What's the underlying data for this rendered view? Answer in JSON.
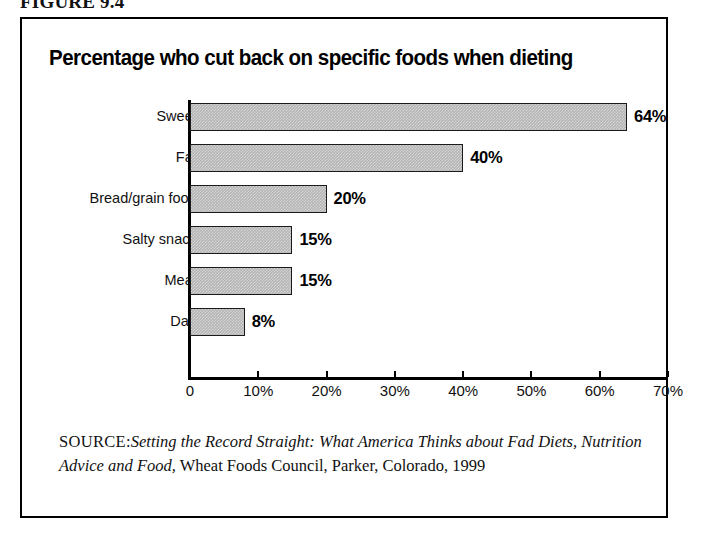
{
  "figure": {
    "number_label": "FIGURE 9.4"
  },
  "chart_data": {
    "type": "bar",
    "orientation": "horizontal",
    "title": "Percentage who cut back on specific foods when dieting",
    "categories": [
      "Sweets",
      "Fats",
      "Bread/grain foods",
      "Salty snacks",
      "Meats",
      "Dairy"
    ],
    "values": [
      64,
      40,
      20,
      15,
      15,
      8
    ],
    "value_labels": [
      "64%",
      "40%",
      "20%",
      "15%",
      "15%",
      "8%"
    ],
    "xlabel": "",
    "ylabel": "",
    "xlim": [
      0,
      70
    ],
    "xticks": [
      0,
      10,
      20,
      30,
      40,
      50,
      60,
      70
    ],
    "xtick_labels": [
      "0",
      "10%",
      "20%",
      "30%",
      "40%",
      "50%",
      "60%",
      "70%"
    ],
    "grid": false,
    "legend": false,
    "bar_fill_color": "#b4b4b4",
    "bar_border_color": "#1a1a1a",
    "axis_color": "#000000"
  },
  "source": {
    "label": "SOURCE:",
    "title_italic": "Setting the Record Straight: What America Thinks about Fad Diets, Nutrition Advice and Food,",
    "publisher": " Wheat Foods Council, Parker, Colorado, 1999"
  }
}
